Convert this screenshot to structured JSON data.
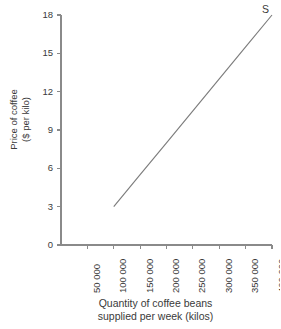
{
  "chart_data": {
    "type": "line",
    "title": "",
    "subtitle": "",
    "xlabel": "Quantity of coffee beans supplied per week (kilos)",
    "xlabel_lines": [
      "Quantity of coffee beans",
      "supplied per week (kilos)"
    ],
    "ylabel": "Price of coffee ($ per kilo)",
    "ylabel_lines": [
      "Price of coffee",
      "($ per kilo)"
    ],
    "xlim": [
      0,
      400000
    ],
    "ylim": [
      0,
      18
    ],
    "xticks": [
      50000,
      100000,
      150000,
      200000,
      250000,
      300000,
      350000,
      400000
    ],
    "xtick_labels": [
      "50 000",
      "100 000",
      "150 000",
      "200 000",
      "250 000",
      "300 000",
      "350 000",
      "400 000"
    ],
    "yticks": [
      0,
      3,
      6,
      9,
      12,
      15,
      18
    ],
    "ytick_labels": [
      "0",
      "3",
      "6",
      "9",
      "12",
      "15",
      "18"
    ],
    "grid": false,
    "legend": null,
    "legend_position": "none",
    "annotations": [
      {
        "text": "S",
        "x": 400000,
        "y": 18,
        "placement": "top-right-of-line-end"
      }
    ],
    "series": [
      {
        "name": "S",
        "label": "Supply curve",
        "color": "#7d7d7d",
        "x": [
          100000,
          400000
        ],
        "values": [
          3,
          18
        ],
        "points": [
          {
            "x": 100000,
            "y": 3
          },
          {
            "x": 150000,
            "y": 5.5
          },
          {
            "x": 200000,
            "y": 8
          },
          {
            "x": 250000,
            "y": 10.5
          },
          {
            "x": 300000,
            "y": 13
          },
          {
            "x": 350000,
            "y": 15.5
          },
          {
            "x": 400000,
            "y": 18
          }
        ]
      }
    ]
  },
  "style": {
    "axis_color": "#8a8a8a",
    "text_color": "#3a3a3a",
    "line_color": "#7d7d7d",
    "background": "#ffffff"
  }
}
